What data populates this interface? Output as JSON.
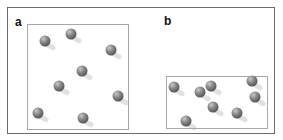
{
  "panels": [
    {
      "label": "a",
      "box": {
        "x": 27,
        "y": 24,
        "w": 102,
        "h": 106
      },
      "spheres": [
        [
          45,
          41
        ],
        [
          71,
          34
        ],
        [
          111,
          50
        ],
        [
          82,
          71
        ],
        [
          59,
          86
        ],
        [
          118,
          96
        ],
        [
          38,
          113
        ],
        [
          83,
          118
        ]
      ]
    },
    {
      "label": "b",
      "box": {
        "x": 166,
        "y": 76,
        "w": 102,
        "h": 53
      },
      "spheres": [
        [
          174,
          87
        ],
        [
          200,
          92
        ],
        [
          211,
          86
        ],
        [
          252,
          81
        ],
        [
          255,
          97
        ],
        [
          213,
          107
        ],
        [
          237,
          113
        ],
        [
          186,
          121
        ]
      ]
    }
  ],
  "labels": {
    "a": "a",
    "b": "b"
  }
}
